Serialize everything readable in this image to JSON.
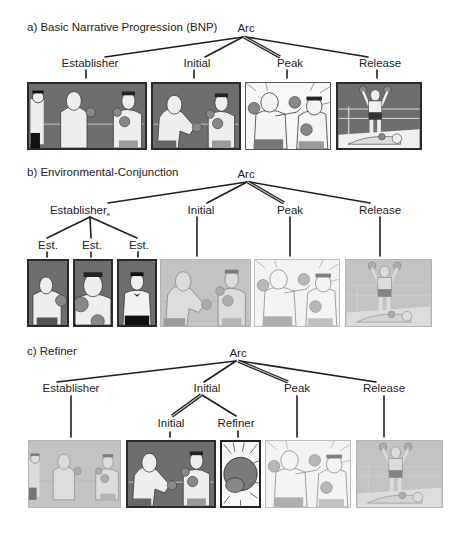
{
  "panels": {
    "a": {
      "title": "a) Basic Narrative Progression (BNP)",
      "root": "Arc",
      "nodes": [
        "Establisher",
        "Initial",
        "Peak",
        "Release"
      ],
      "peak_link_style": "double-line",
      "frames": [
        {
          "role": "Establisher",
          "depicts": "referee and two boxers facing off",
          "style": "dark"
        },
        {
          "role": "Initial",
          "depicts": "bald boxer winding up a punch",
          "style": "dark"
        },
        {
          "role": "Peak",
          "depicts": "punch lands on opponent",
          "style": "light"
        },
        {
          "role": "Release",
          "depicts": "winner raising arms over fallen opponent",
          "style": "dark"
        }
      ]
    },
    "b": {
      "title": "b) Environmental-Conjunction",
      "root": "Arc",
      "nodes": [
        "Establisher",
        "Initial",
        "Peak",
        "Release"
      ],
      "establisher_subscript": "e",
      "sub_nodes": [
        "Est.",
        "Est.",
        "Est."
      ],
      "peak_link_style": "double-line",
      "frames": [
        {
          "role": "Est.",
          "depicts": "bald boxer from behind",
          "style": "dark"
        },
        {
          "role": "Est.",
          "depicts": "dark-haired boxer close-up",
          "style": "dark"
        },
        {
          "role": "Est.",
          "depicts": "referee",
          "style": "dark"
        },
        {
          "role": "Initial",
          "depicts": "bald boxer winding up a punch",
          "style": "faded"
        },
        {
          "role": "Peak",
          "depicts": "punch lands on opponent",
          "style": "faded-light"
        },
        {
          "role": "Release",
          "depicts": "winner raising arms over fallen opponent",
          "style": "faded"
        }
      ]
    },
    "c": {
      "title": "c) Refiner",
      "root": "Arc",
      "nodes": [
        "Establisher",
        "Initial",
        "Peak",
        "Release"
      ],
      "initial_children": [
        "Initial",
        "Refiner"
      ],
      "peak_link_style": "double-line",
      "initial_link_style": "double-line",
      "frames": [
        {
          "role": "Establisher",
          "depicts": "two boxers facing off",
          "style": "faded"
        },
        {
          "role": "Initial",
          "depicts": "bald boxer winding up a punch",
          "style": "dark"
        },
        {
          "role": "Refiner",
          "depicts": "close-up of boxing glove with speed lines",
          "style": "light"
        },
        {
          "role": "Peak",
          "depicts": "punch lands on opponent",
          "style": "faded-light"
        },
        {
          "role": "Release",
          "depicts": "winner raising arms over fallen opponent",
          "style": "faded"
        }
      ]
    }
  }
}
